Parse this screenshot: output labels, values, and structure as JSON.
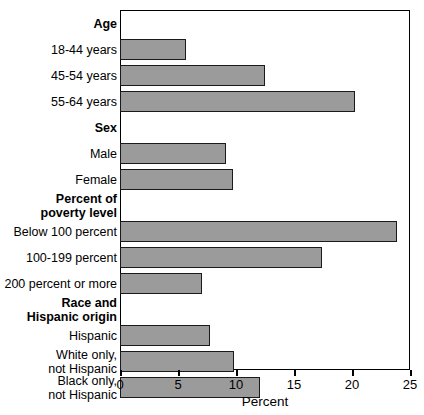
{
  "chart_data": {
    "type": "bar",
    "orientation": "horizontal",
    "title": "",
    "xlabel": "Percent",
    "ylabel": "",
    "xlim": [
      0,
      25
    ],
    "xticks": [
      0,
      5,
      10,
      15,
      20,
      25
    ],
    "xtick_labels": [
      "0",
      "5",
      "10",
      "15",
      "20",
      "25"
    ],
    "grid": false,
    "legend": null,
    "bar_color": "#9b9b9b",
    "bar_border_color": "#1a1a1a",
    "groups": [
      {
        "header": "Age",
        "header_lines": [
          "Age"
        ],
        "items": [
          {
            "label": "18-44 years",
            "label_lines": [
              "18-44 years"
            ],
            "value": 5.7
          },
          {
            "label": "45-54 years",
            "label_lines": [
              "45-54 years"
            ],
            "value": 12.5
          },
          {
            "label": "55-64 years",
            "label_lines": [
              "55-64 years"
            ],
            "value": 20.3
          }
        ]
      },
      {
        "header": "Sex",
        "header_lines": [
          "Sex"
        ],
        "items": [
          {
            "label": "Male",
            "label_lines": [
              "Male"
            ],
            "value": 9.1
          },
          {
            "label": "Female",
            "label_lines": [
              "Female"
            ],
            "value": 9.7
          }
        ]
      },
      {
        "header": "Percent of poverty level",
        "header_lines": [
          "Percent of",
          "poverty level"
        ],
        "items": [
          {
            "label": "Below 100 percent",
            "label_lines": [
              "Below 100 percent"
            ],
            "value": 23.9
          },
          {
            "label": "100-199 percent",
            "label_lines": [
              "100-199 percent"
            ],
            "value": 17.4
          },
          {
            "label": "200 percent or more",
            "label_lines": [
              "200 percent or more"
            ],
            "value": 7.1
          }
        ]
      },
      {
        "header": "Race and Hispanic origin",
        "header_lines": [
          "Race and",
          "Hispanic origin"
        ],
        "items": [
          {
            "label": "Hispanic",
            "label_lines": [
              "Hispanic"
            ],
            "value": 7.8
          },
          {
            "label": "White only, not Hispanic",
            "label_lines": [
              "White only,",
              "not Hispanic"
            ],
            "value": 9.8
          },
          {
            "label": "Black only, not Hispanic",
            "label_lines": [
              "Black only,",
              "not Hispanic"
            ],
            "value": 12.1
          }
        ]
      }
    ]
  }
}
